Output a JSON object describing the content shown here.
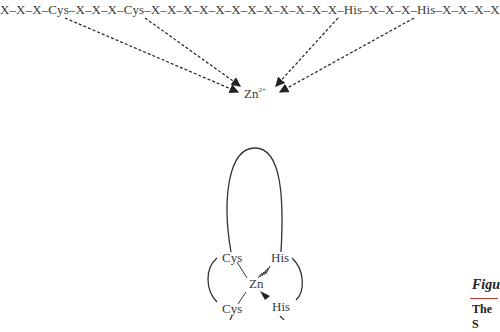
{
  "sequence": {
    "text": "X–X–X–Cys–X–X–X–Cys–X–X–X–X–X–X–X–X–X–X–X–X–His–X–X–X–His–X–X–X–X"
  },
  "ion": {
    "symbol": "Zn",
    "charge": "2+"
  },
  "structure": {
    "center": "Zn",
    "cys_top": "Cys",
    "cys_bottom": "Cys",
    "his_top": "His",
    "his_bottom": "His"
  },
  "caption": {
    "figure_label": "Figu",
    "subtitle": "The S"
  }
}
